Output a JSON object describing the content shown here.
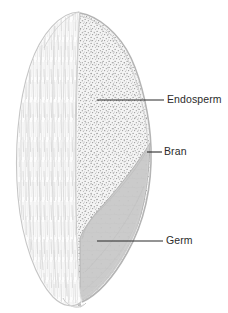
{
  "figure": {
    "background_color": "#ffffff",
    "width": 228,
    "height": 313
  },
  "labels": [
    {
      "id": "endosperm",
      "text": "Endosperm",
      "leader": {
        "x1": 97,
        "y1": 100,
        "x2": 164,
        "y2": 100
      },
      "text_x": 167,
      "text_y": 100,
      "color": "#2b2b2b"
    },
    {
      "id": "bran",
      "text": "Bran",
      "leader": {
        "x1": 147,
        "y1": 152,
        "x2": 162,
        "y2": 152
      },
      "text_x": 164,
      "text_y": 152,
      "color": "#2b2b2b"
    },
    {
      "id": "germ",
      "text": "Germ",
      "leader": {
        "x1": 97,
        "y1": 241,
        "x2": 163,
        "y2": 241
      },
      "text_x": 166,
      "text_y": 241,
      "color": "#2b2b2b"
    }
  ],
  "parts": {
    "outer_surface": {
      "name": "outer-kernel-surface",
      "description": "Intact rounded outer face of the kernel with fine vertical hatching",
      "fill": "#fdfdfd",
      "stroke": "#c9c9c9",
      "hatch_color": "#dcdcdc"
    },
    "bran": {
      "name": "bran-layer",
      "description": "Thin multi-layered coat band running down the cut edge",
      "fill": "#c4c4c4",
      "stroke": "#a8a8a8"
    },
    "endosperm": {
      "name": "endosperm-region",
      "description": "Large stippled starchy region filling the upper cut face",
      "fill": "#f2f2f2",
      "stipple_color": "#9a9a9a"
    },
    "germ": {
      "name": "germ-region",
      "description": "Smooth gray embryo wedge at the lower cut face",
      "fill": "#c9c9c9",
      "stroke": "#ababab"
    }
  }
}
